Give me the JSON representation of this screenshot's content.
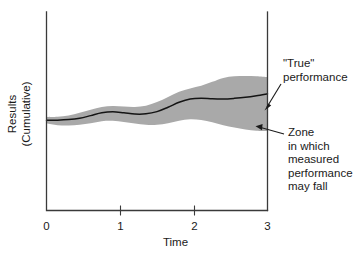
{
  "chart_data": {
    "type": "area",
    "title": "",
    "subtitle": "",
    "xlabel": "Time",
    "ylabel": "Results (Cumulative)",
    "ylabel_lines": [
      "Results",
      "(Cumulative)"
    ],
    "xticks": [
      "0",
      "1",
      "2",
      "3"
    ],
    "xtick_values": [
      0,
      1,
      2,
      3
    ],
    "xlim": [
      0,
      3
    ],
    "ylim": [
      0,
      1
    ],
    "yticks": [],
    "grid": false,
    "legend": null,
    "series": [
      {
        "name": "\"True\" performance",
        "type": "line",
        "color": "#141414",
        "x": [
          0.0,
          0.15,
          0.3,
          0.45,
          0.6,
          0.75,
          0.9,
          1.05,
          1.2,
          1.35,
          1.5,
          1.65,
          1.8,
          1.95,
          2.1,
          2.25,
          2.4,
          2.55,
          2.7,
          2.85,
          3.0
        ],
        "y": [
          0.455,
          0.455,
          0.458,
          0.465,
          0.478,
          0.492,
          0.497,
          0.492,
          0.486,
          0.487,
          0.498,
          0.52,
          0.545,
          0.562,
          0.566,
          0.563,
          0.562,
          0.565,
          0.57,
          0.578,
          0.588
        ]
      },
      {
        "name": "Zone in which measured performance may fall",
        "type": "band",
        "color": "#a9a9a9",
        "x": [
          0.0,
          0.15,
          0.3,
          0.45,
          0.6,
          0.75,
          0.9,
          1.05,
          1.2,
          1.35,
          1.5,
          1.65,
          1.8,
          1.95,
          2.1,
          2.25,
          2.4,
          2.55,
          2.7,
          2.85,
          3.0
        ],
        "upper": [
          0.47,
          0.472,
          0.478,
          0.492,
          0.508,
          0.522,
          0.527,
          0.524,
          0.522,
          0.528,
          0.546,
          0.572,
          0.598,
          0.615,
          0.628,
          0.648,
          0.668,
          0.676,
          0.678,
          0.676,
          0.672
        ],
        "lower": [
          0.438,
          0.43,
          0.428,
          0.432,
          0.44,
          0.45,
          0.452,
          0.446,
          0.438,
          0.432,
          0.432,
          0.44,
          0.452,
          0.46,
          0.456,
          0.444,
          0.43,
          0.418,
          0.408,
          0.402,
          0.4
        ]
      }
    ],
    "annotations": [
      {
        "id": "true-performance",
        "lines": [
          "\"True\"",
          "performance"
        ],
        "target_x": 3.0,
        "target_y": 0.588
      },
      {
        "id": "measurement-zone",
        "lines": [
          "Zone",
          "in which",
          "measured",
          "performance",
          "may fall"
        ],
        "target_x": 2.82,
        "target_y": 0.455
      }
    ],
    "colors": {
      "band": "#a9a9a9",
      "line": "#141414",
      "axis": "#3a3a3a",
      "text": "#1a1a1a",
      "background": "#ffffff"
    }
  }
}
